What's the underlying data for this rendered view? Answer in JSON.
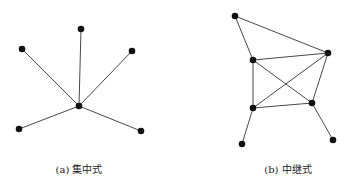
{
  "figures": [
    {
      "id": "a",
      "caption": "(a) 集中式",
      "caption_x": 79,
      "nodes": [
        {
          "id": "hub",
          "x": 79,
          "y": 106
        },
        {
          "id": "n1",
          "x": 81,
          "y": 29
        },
        {
          "id": "n2",
          "x": 22,
          "y": 49
        },
        {
          "id": "n3",
          "x": 132,
          "y": 51
        },
        {
          "id": "n4",
          "x": 19,
          "y": 129
        },
        {
          "id": "n5",
          "x": 141,
          "y": 131
        }
      ],
      "edges": [
        [
          "hub",
          "n1"
        ],
        [
          "hub",
          "n2"
        ],
        [
          "hub",
          "n3"
        ],
        [
          "hub",
          "n4"
        ],
        [
          "hub",
          "n5"
        ]
      ]
    },
    {
      "id": "b",
      "caption": "(b) 中继式",
      "caption_x": 288,
      "nodes": [
        {
          "id": "A",
          "x": 235,
          "y": 16
        },
        {
          "id": "B",
          "x": 328,
          "y": 53
        },
        {
          "id": "C",
          "x": 253,
          "y": 60
        },
        {
          "id": "D",
          "x": 253,
          "y": 108
        },
        {
          "id": "E",
          "x": 312,
          "y": 103
        },
        {
          "id": "F",
          "x": 242,
          "y": 144
        },
        {
          "id": "G",
          "x": 333,
          "y": 140
        }
      ],
      "edges": [
        [
          "A",
          "B"
        ],
        [
          "A",
          "C"
        ],
        [
          "C",
          "B"
        ],
        [
          "C",
          "D"
        ],
        [
          "C",
          "E"
        ],
        [
          "D",
          "B"
        ],
        [
          "D",
          "E"
        ],
        [
          "E",
          "B"
        ],
        [
          "D",
          "F"
        ],
        [
          "E",
          "G"
        ]
      ]
    }
  ],
  "style": {
    "node_color": "#111111",
    "edge_color": "#333333",
    "node_radius": 3.3
  }
}
